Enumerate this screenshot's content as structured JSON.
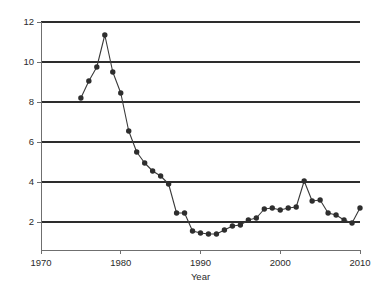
{
  "chart_data": {
    "type": "line",
    "title": "",
    "subtitle": "",
    "xlabel": "Year",
    "ylabel": "",
    "xlim": [
      1970,
      2010
    ],
    "ylim": [
      0.6,
      12
    ],
    "xticks": [
      1970,
      1980,
      1990,
      2000,
      2010
    ],
    "yticks": [
      2,
      4,
      6,
      8,
      10,
      12
    ],
    "xtick_labels": [
      "1970",
      "1980",
      "1990",
      "2000",
      "2010"
    ],
    "ytick_labels": [
      "2",
      "4",
      "6",
      "8",
      "10",
      "12"
    ],
    "grid": "horizontal",
    "legend": "none",
    "marker": "filled-circle",
    "line_color": "#3a3a3a",
    "marker_color": "#2e2e2e",
    "grid_color": "#2d2d2d",
    "axis_color": "#6f6f6f",
    "background_color": "#ffffff",
    "x": [
      1975,
      1976,
      1977,
      1978,
      1979,
      1980,
      1981,
      1982,
      1983,
      1984,
      1985,
      1986,
      1987,
      1988,
      1989,
      1990,
      1991,
      1992,
      1993,
      1994,
      1995,
      1996,
      1997,
      1998,
      1999,
      2000,
      2001,
      2002,
      2003,
      2004,
      2005,
      2006,
      2007,
      2008,
      2009,
      2010
    ],
    "values": [
      8.2,
      9.05,
      9.75,
      11.35,
      9.5,
      8.45,
      6.55,
      5.5,
      4.95,
      4.55,
      4.3,
      3.9,
      2.45,
      2.45,
      1.55,
      1.45,
      1.4,
      1.4,
      1.6,
      1.8,
      1.85,
      2.1,
      2.2,
      2.65,
      2.7,
      2.6,
      2.7,
      2.75,
      4.05,
      3.05,
      3.1,
      2.45,
      2.35,
      2.1,
      1.95,
      2.7
    ],
    "series": [
      {
        "name": "series-1",
        "x": [
          1975,
          1976,
          1977,
          1978,
          1979,
          1980,
          1981,
          1982,
          1983,
          1984,
          1985,
          1986,
          1987,
          1988,
          1989,
          1990,
          1991,
          1992,
          1993,
          1994,
          1995,
          1996,
          1997,
          1998,
          1999,
          2000,
          2001,
          2002,
          2003,
          2004,
          2005,
          2006,
          2007,
          2008,
          2009,
          2010
        ],
        "values": [
          8.2,
          9.05,
          9.75,
          11.35,
          9.5,
          8.45,
          6.55,
          5.5,
          4.95,
          4.55,
          4.3,
          3.9,
          2.45,
          2.45,
          1.55,
          1.45,
          1.4,
          1.4,
          1.6,
          1.8,
          1.85,
          2.1,
          2.2,
          2.65,
          2.7,
          2.6,
          2.7,
          2.75,
          4.05,
          3.05,
          3.1,
          2.45,
          2.35,
          2.1,
          1.95,
          2.7
        ]
      }
    ]
  },
  "geometry": {
    "plot_left": 41,
    "plot_right": 360,
    "plot_top": 22,
    "plot_bottom": 250,
    "marker_radius": 2.7
  }
}
